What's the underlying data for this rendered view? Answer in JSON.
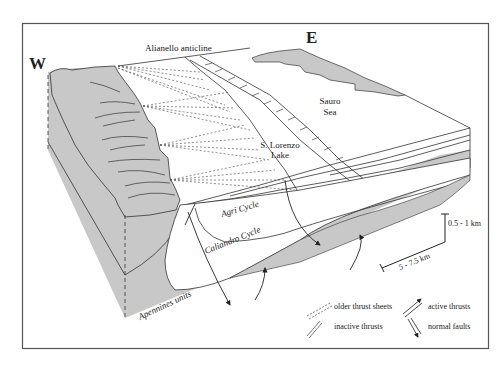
{
  "orientation": {
    "west": "W",
    "east": "E"
  },
  "labels": {
    "anticline": "Alianello anticline",
    "sea_line1": "Sauro",
    "sea_line2": "Sea",
    "lake_line1": "S. Lorenzo",
    "lake_line2": "Lake",
    "agri": "Agri Cycle",
    "caliandro": "Caliandro Cycle",
    "apennines": "Apennines units"
  },
  "scale": {
    "vertical": "0.5 - 1 km",
    "horizontal": "5 - 7.5 km"
  },
  "legend": {
    "items": [
      {
        "symbol": "older-thrust-sheets",
        "label": "older thrust sheets"
      },
      {
        "symbol": "active-thrusts",
        "label": "active thrusts"
      },
      {
        "symbol": "inactive-thrusts",
        "label": "inactive thrusts"
      },
      {
        "symbol": "normal-faults",
        "label": "normal faults"
      }
    ]
  },
  "colors": {
    "unit_fill": "#c8c8c8",
    "line": "#333333",
    "frame": "#555555",
    "background": "#ffffff"
  }
}
